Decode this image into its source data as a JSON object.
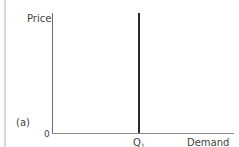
{
  "figure": {
    "panel_label": "(a)",
    "y_axis_label": "Price",
    "x_axis_label": "Demand",
    "origin_label": "0",
    "quantity_label": "Q",
    "quantity_subscript": "1"
  },
  "colors": {
    "axis": "#6a6a6a",
    "demand_line": "#2b2b2b",
    "text": "#3f3f3f",
    "background": "#ffffff"
  },
  "chart_data": {
    "type": "line",
    "title": "",
    "xlabel": "Demand",
    "ylabel": "Price",
    "panel": "(a)",
    "origin": "0",
    "x_ticks": [
      "Q1"
    ],
    "series": [
      {
        "name": "Perfectly inelastic demand (vertical at Q1)",
        "x": [
          "Q1",
          "Q1"
        ],
        "y": [
          "0",
          "max"
        ]
      }
    ],
    "grid": false,
    "legend": false
  }
}
